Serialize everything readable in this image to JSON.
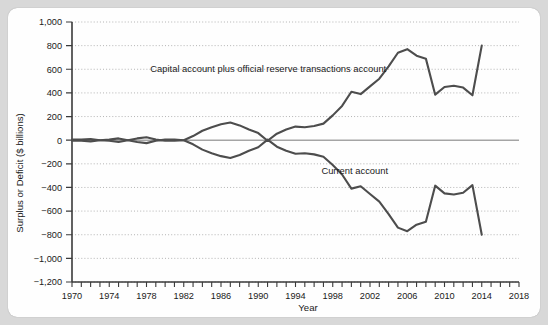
{
  "chart_data": {
    "type": "line",
    "title": "",
    "xlabel": "Year",
    "ylabel": "Surplus or Deficit ($ billions)",
    "xlim": [
      1970,
      2018
    ],
    "ylim": [
      -1200,
      1000
    ],
    "ytick_step": 200,
    "xtick_step": 1,
    "xtick_label_step": 4,
    "grid": true,
    "grid_style": "dotted-horizontal",
    "legend_position": "inline-annotation",
    "zero_line": true,
    "y_ticks": [
      1000,
      800,
      600,
      400,
      200,
      0,
      -200,
      -400,
      -600,
      -800,
      -1000,
      -1200
    ],
    "y_tick_labels": [
      "1,000",
      "800",
      "600",
      "400",
      "200",
      "0",
      "−200",
      "−400",
      "−600",
      "−800",
      "−1,000",
      "−1,200"
    ],
    "x_ticks": [
      1970,
      1971,
      1972,
      1973,
      1974,
      1975,
      1976,
      1977,
      1978,
      1979,
      1980,
      1981,
      1982,
      1983,
      1984,
      1985,
      1986,
      1987,
      1988,
      1989,
      1990,
      1991,
      1992,
      1993,
      1994,
      1995,
      1996,
      1997,
      1998,
      1999,
      2000,
      2001,
      2002,
      2003,
      2004,
      2005,
      2006,
      2007,
      2008,
      2009,
      2010,
      2011,
      2012,
      2013,
      2014,
      2015,
      2016,
      2017,
      2018
    ],
    "x_tick_labels": [
      "1970",
      "1974",
      "1978",
      "1982",
      "1986",
      "1990",
      "1994",
      "1998",
      "2002",
      "2006",
      "2010",
      "2014",
      "2018"
    ],
    "x_tick_label_values": [
      1970,
      1974,
      1978,
      1982,
      1986,
      1990,
      1994,
      1998,
      2002,
      2006,
      2010,
      2014,
      2018
    ],
    "x": [
      1970,
      1971,
      1972,
      1973,
      1974,
      1975,
      1976,
      1977,
      1978,
      1979,
      1980,
      1981,
      1982,
      1983,
      1984,
      1985,
      1986,
      1987,
      1988,
      1989,
      1990,
      1991,
      1992,
      1993,
      1994,
      1995,
      1996,
      1997,
      1998,
      1999,
      2000,
      2001,
      2002,
      2003,
      2004,
      2005,
      2006,
      2007,
      2008,
      2009,
      2010,
      2011,
      2012,
      2013,
      2014
    ],
    "series": [
      {
        "name": "Capital account plus official reserve transactions account",
        "color": "#4d4d4d",
        "label_x": 1987,
        "label_y": 600,
        "values": [
          5,
          5,
          10,
          0,
          -5,
          -15,
          0,
          15,
          25,
          5,
          -5,
          -5,
          0,
          35,
          80,
          110,
          135,
          150,
          125,
          90,
          60,
          -5,
          55,
          90,
          115,
          110,
          120,
          140,
          210,
          290,
          410,
          390,
          455,
          520,
          625,
          740,
          770,
          715,
          690,
          385,
          450,
          460,
          445,
          380,
          800
        ]
      },
      {
        "name": "Current account",
        "color": "#4d4d4d",
        "label_x": 2000,
        "label_y": -260,
        "values": [
          -5,
          -5,
          -10,
          0,
          5,
          15,
          0,
          -15,
          -25,
          -5,
          5,
          5,
          0,
          -35,
          -80,
          -110,
          -135,
          -150,
          -125,
          -90,
          -60,
          5,
          -55,
          -90,
          -115,
          -110,
          -120,
          -140,
          -210,
          -290,
          -410,
          -390,
          -455,
          -520,
          -625,
          -740,
          -770,
          -715,
          -690,
          -385,
          -450,
          -460,
          -445,
          -380,
          -800
        ]
      }
    ]
  }
}
